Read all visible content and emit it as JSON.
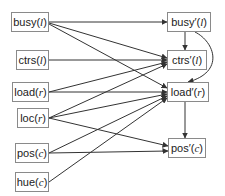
{
  "diagram": {
    "left_nodes": [
      {
        "id": "busy",
        "name": "busy",
        "arg": "l"
      },
      {
        "id": "ctrs",
        "name": "ctrs",
        "arg": "l"
      },
      {
        "id": "load",
        "name": "load",
        "arg": "r"
      },
      {
        "id": "loc",
        "name": "loc",
        "arg": "r"
      },
      {
        "id": "pos",
        "name": "pos",
        "arg": "c"
      },
      {
        "id": "hue",
        "name": "hue",
        "arg": "c"
      }
    ],
    "right_nodes": [
      {
        "id": "busy_p",
        "name": "busy′",
        "arg": "l"
      },
      {
        "id": "ctrs_p",
        "name": "ctrs′",
        "arg": "l"
      },
      {
        "id": "load_p",
        "name": "load′",
        "arg": "r"
      },
      {
        "id": "pos_p",
        "name": "pos′",
        "arg": "c"
      }
    ],
    "edges": [
      [
        "busy",
        "busy_p"
      ],
      [
        "busy",
        "ctrs_p"
      ],
      [
        "busy",
        "load_p"
      ],
      [
        "ctrs",
        "ctrs_p"
      ],
      [
        "load",
        "ctrs_p"
      ],
      [
        "load",
        "load_p"
      ],
      [
        "loc",
        "ctrs_p"
      ],
      [
        "loc",
        "load_p"
      ],
      [
        "loc",
        "pos_p"
      ],
      [
        "pos",
        "load_p"
      ],
      [
        "pos",
        "pos_p"
      ],
      [
        "hue",
        "load_p"
      ],
      [
        "busy_p",
        "ctrs_p"
      ],
      [
        "busy_p",
        "load_p"
      ],
      [
        "load_p",
        "pos_p"
      ]
    ],
    "colors": {
      "edge": "#333333",
      "border": "#8a8a8a"
    }
  }
}
